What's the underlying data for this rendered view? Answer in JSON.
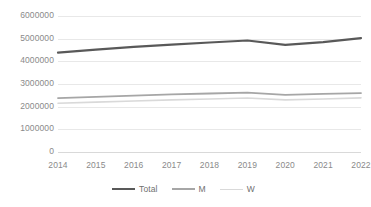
{
  "chart_data": {
    "type": "line",
    "title": "",
    "xlabel": "",
    "ylabel": "",
    "categories": [
      "2014",
      "2015",
      "2016",
      "2017",
      "2018",
      "2019",
      "2020",
      "2021",
      "2022"
    ],
    "x": [
      2014,
      2015,
      2016,
      2017,
      2018,
      2019,
      2020,
      2021,
      2022
    ],
    "ylim": [
      0,
      6000000
    ],
    "ytick_values": [
      0,
      1000000,
      2000000,
      3000000,
      4000000,
      5000000,
      6000000
    ],
    "ytick_labels": [
      "0",
      "1000000",
      "2000000",
      "3000000",
      "4000000",
      "5000000",
      "6000000"
    ],
    "grid": true,
    "legend_position": "bottom",
    "series": [
      {
        "name": "Total",
        "color": "#595959",
        "width": 2.2,
        "values": [
          4380000,
          4520000,
          4640000,
          4740000,
          4830000,
          4920000,
          4730000,
          4850000,
          5020000
        ]
      },
      {
        "name": "M",
        "color": "#a6a6a6",
        "width": 1.8,
        "values": [
          2380000,
          2430000,
          2490000,
          2540000,
          2580000,
          2620000,
          2520000,
          2560000,
          2600000
        ]
      },
      {
        "name": "W",
        "color": "#d9d9d9",
        "width": 1.6,
        "values": [
          2150000,
          2200000,
          2250000,
          2300000,
          2340000,
          2380000,
          2300000,
          2340000,
          2390000
        ]
      }
    ]
  },
  "axis": {
    "y_labels": [
      "6000000",
      "5000000",
      "4000000",
      "3000000",
      "2000000",
      "1000000",
      "0"
    ],
    "x_labels": [
      "2014",
      "2015",
      "2016",
      "2017",
      "2018",
      "2019",
      "2020",
      "2021",
      "2022"
    ]
  },
  "legend": {
    "items": [
      {
        "label": "Total",
        "color": "#595959",
        "thickness": "2.4px"
      },
      {
        "label": "M",
        "color": "#a6a6a6",
        "thickness": "2px"
      },
      {
        "label": "W",
        "color": "#d9d9d9",
        "thickness": "1.6px"
      }
    ]
  },
  "colors": {
    "gridline": "#e8e8e8",
    "text": "#8a8a8a",
    "background": "#ffffff"
  }
}
